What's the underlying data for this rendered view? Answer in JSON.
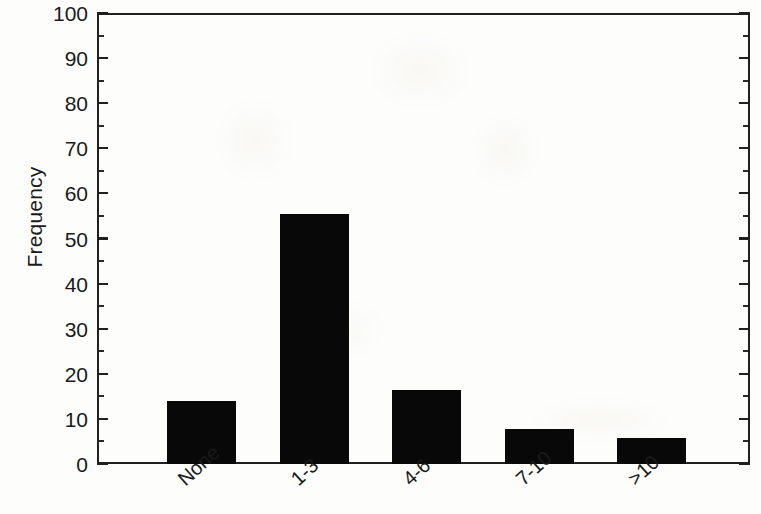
{
  "chart_data": {
    "type": "bar",
    "title": "",
    "subtitle": "",
    "xlabel": "",
    "ylabel": "Frequency",
    "categories": [
      "None",
      "1-3",
      "4-6",
      "7-10",
      ">10"
    ],
    "values": [
      14,
      55.5,
      16.4,
      7.8,
      5.8
    ],
    "series": [
      {
        "name": "Frequency",
        "values": [
          14,
          55.5,
          16.4,
          7.8,
          5.8
        ]
      }
    ],
    "ylim": [
      0,
      100
    ],
    "ytick_labels": [
      "0",
      "10",
      "20",
      "30",
      "40",
      "50",
      "60",
      "70",
      "80",
      "90",
      "100"
    ],
    "ytick_values": [
      0,
      10,
      20,
      30,
      40,
      50,
      60,
      70,
      80,
      90,
      100
    ],
    "yminor_tick_interval": 5,
    "grid": false,
    "legend": null,
    "legend_position": "none",
    "bar_color": "#080808",
    "axis_color": "#202020",
    "background_color": "#fdfdfb",
    "xtick_label_rotation_degrees": -42,
    "annotations": []
  },
  "axes": {
    "y_title": "Frequency"
  }
}
